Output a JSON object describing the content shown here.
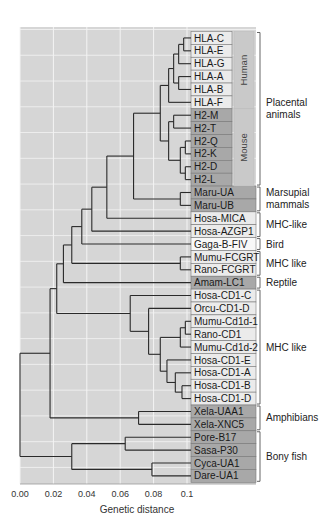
{
  "figure": {
    "type": "dendrogram",
    "x_axis_title": "Genetic distance",
    "x_ticks": [
      "0.00",
      "0.02",
      "0.04",
      "0.06",
      "0.08",
      "0.1"
    ],
    "x_tick_values": [
      0.0,
      0.02,
      0.04,
      0.06,
      0.08,
      0.1
    ],
    "colors": {
      "plot_bg": "#d6d6d6",
      "grid": "#f4f4f4",
      "branch": "#2a2a2a",
      "box_light": "#ebebeb",
      "box_white": "#f8f8f8",
      "box_dark": "#a8a8a8",
      "box_mid": "#b4b4b4",
      "side_col": "#c9c9c9",
      "box_border": "#7a7a7a"
    }
  },
  "leaves": [
    {
      "label": "HLA-C",
      "shade": "light",
      "narrow": true
    },
    {
      "label": "HLA-E",
      "shade": "light",
      "narrow": true
    },
    {
      "label": "HLA-G",
      "shade": "light",
      "narrow": true
    },
    {
      "label": "HLA-A",
      "shade": "light",
      "narrow": true
    },
    {
      "label": "HLA-B",
      "shade": "light",
      "narrow": true
    },
    {
      "label": "HLA-F",
      "shade": "light",
      "narrow": true
    },
    {
      "label": "H2-M",
      "shade": "dark",
      "narrow": true
    },
    {
      "label": "H2-T",
      "shade": "dark",
      "narrow": true
    },
    {
      "label": "H2-Q",
      "shade": "dark",
      "narrow": true
    },
    {
      "label": "H2-K",
      "shade": "dark",
      "narrow": true
    },
    {
      "label": "H2-D",
      "shade": "dark",
      "narrow": true
    },
    {
      "label": "H2-L",
      "shade": "dark",
      "narrow": true
    },
    {
      "label": "Maru-UA",
      "shade": "dark"
    },
    {
      "label": "Maru-UB",
      "shade": "dark"
    },
    {
      "label": "Hosa-MICA",
      "shade": "light"
    },
    {
      "label": "Hosa-AZGP1",
      "shade": "light"
    },
    {
      "label": "Gaga-B-FIV",
      "shade": "white"
    },
    {
      "label": "Mumu-FCGRT",
      "shade": "light"
    },
    {
      "label": "Rano-FCGRT",
      "shade": "light"
    },
    {
      "label": "Amam-LC1",
      "shade": "dark"
    },
    {
      "label": "Hosa-CD1-C",
      "shade": "light"
    },
    {
      "label": "Orcu-CD1-D",
      "shade": "light"
    },
    {
      "label": "Mumu-Cd1d-1",
      "shade": "light"
    },
    {
      "label": "Rano-CD1",
      "shade": "light"
    },
    {
      "label": "Mumu-Cd1d-2",
      "shade": "light"
    },
    {
      "label": "Hosa-CD1-E",
      "shade": "light"
    },
    {
      "label": "Hosa-CD1-A",
      "shade": "light"
    },
    {
      "label": "Hosa-CD1-B",
      "shade": "light"
    },
    {
      "label": "Hosa-CD1-D",
      "shade": "light"
    },
    {
      "label": "Xela-UAA1",
      "shade": "dark"
    },
    {
      "label": "Xela-XNC5",
      "shade": "dark"
    },
    {
      "label": "Pore-B17",
      "shade": "dark"
    },
    {
      "label": "Sasa-P30",
      "shade": "dark"
    },
    {
      "label": "Cyca-UA1",
      "shade": "dark"
    },
    {
      "label": "Dare-UA1",
      "shade": "dark"
    }
  ],
  "side_columns": [
    {
      "label": "Human",
      "from": 0,
      "to": 5
    },
    {
      "label": "Mouse",
      "from": 6,
      "to": 11
    }
  ],
  "groups": [
    {
      "label_lines": [
        "Placental",
        "animals"
      ],
      "from": 0,
      "to": 11
    },
    {
      "label_lines": [
        "Marsupial",
        "mammals"
      ],
      "from": 12,
      "to": 13
    },
    {
      "label_lines": [
        "MHC-like"
      ],
      "from": 14,
      "to": 15
    },
    {
      "label_lines": [
        "Bird"
      ],
      "from": 16,
      "to": 16
    },
    {
      "label_lines": [
        "MHC like"
      ],
      "from": 17,
      "to": 18
    },
    {
      "label_lines": [
        "Reptile"
      ],
      "from": 19,
      "to": 19
    },
    {
      "label_lines": [
        "MHC like"
      ],
      "from": 20,
      "to": 28
    },
    {
      "label_lines": [
        "Amphibians"
      ],
      "from": 29,
      "to": 30
    },
    {
      "label_lines": [
        "Bony fish"
      ],
      "from": 31,
      "to": 34
    }
  ],
  "tree": {
    "note": "Nodes: distance is approximate genetic distance of the merge; children reference leaf indices (L#) or other nodes (N#)",
    "nodes": [
      {
        "id": "N1",
        "d": 0.098,
        "children": [
          "L0",
          "L1"
        ]
      },
      {
        "id": "N2",
        "d": 0.095,
        "children": [
          "N1",
          "L2"
        ]
      },
      {
        "id": "N3",
        "d": 0.095,
        "children": [
          "L3",
          "L4"
        ]
      },
      {
        "id": "N4",
        "d": 0.092,
        "children": [
          "N2",
          "N3"
        ]
      },
      {
        "id": "N5",
        "d": 0.089,
        "children": [
          "N4",
          "L5"
        ]
      },
      {
        "id": "N6",
        "d": 0.092,
        "children": [
          "L6",
          "L7"
        ]
      },
      {
        "id": "N7",
        "d": 0.099,
        "children": [
          "L8",
          "L9"
        ]
      },
      {
        "id": "N8",
        "d": 0.099,
        "children": [
          "L10",
          "L11"
        ]
      },
      {
        "id": "N9",
        "d": 0.096,
        "children": [
          "N7",
          "N8"
        ]
      },
      {
        "id": "N10",
        "d": 0.089,
        "children": [
          "N6",
          "N9"
        ]
      },
      {
        "id": "N11",
        "d": 0.084,
        "children": [
          "N5",
          "N10"
        ]
      },
      {
        "id": "N12",
        "d": 0.096,
        "children": [
          "L12",
          "L13"
        ]
      },
      {
        "id": "N13",
        "d": 0.068,
        "children": [
          "N11",
          "N12"
        ]
      },
      {
        "id": "N14",
        "d": 0.052,
        "children": [
          "N13",
          "L14"
        ]
      },
      {
        "id": "N15",
        "d": 0.043,
        "children": [
          "N14",
          "L15"
        ]
      },
      {
        "id": "N16",
        "d": 0.037,
        "children": [
          "N15",
          "L16"
        ]
      },
      {
        "id": "N17",
        "d": 0.096,
        "children": [
          "L17",
          "L18"
        ]
      },
      {
        "id": "N18",
        "d": 0.031,
        "children": [
          "N16",
          "N17"
        ]
      },
      {
        "id": "N19",
        "d": 0.026,
        "children": [
          "N18",
          "L19"
        ]
      },
      {
        "id": "N20",
        "d": 0.099,
        "children": [
          "L22",
          "L23"
        ]
      },
      {
        "id": "N21",
        "d": 0.096,
        "children": [
          "N20",
          "L24"
        ]
      },
      {
        "id": "N22",
        "d": 0.097,
        "children": [
          "L27",
          "L28"
        ]
      },
      {
        "id": "N23",
        "d": 0.093,
        "children": [
          "L26",
          "N22"
        ]
      },
      {
        "id": "N24",
        "d": 0.088,
        "children": [
          "L25",
          "N23"
        ]
      },
      {
        "id": "N25",
        "d": 0.084,
        "children": [
          "N21",
          "N24"
        ]
      },
      {
        "id": "N26",
        "d": 0.077,
        "children": [
          "L21",
          "N25"
        ]
      },
      {
        "id": "N27",
        "d": 0.066,
        "children": [
          "L20",
          "N26"
        ]
      },
      {
        "id": "N28",
        "d": 0.022,
        "children": [
          "N19",
          "N27"
        ]
      },
      {
        "id": "N29",
        "d": 0.071,
        "children": [
          "L29",
          "L30"
        ]
      },
      {
        "id": "N30",
        "d": 0.018,
        "children": [
          "N28",
          "N29"
        ]
      },
      {
        "id": "N31",
        "d": 0.063,
        "children": [
          "L31",
          "L32"
        ]
      },
      {
        "id": "N32",
        "d": 0.079,
        "children": [
          "L33",
          "L34"
        ]
      },
      {
        "id": "N33",
        "d": 0.031,
        "children": [
          "N31",
          "N32"
        ]
      },
      {
        "id": "N34",
        "d": 0.0,
        "children": [
          "N30",
          "N33"
        ]
      }
    ]
  }
}
